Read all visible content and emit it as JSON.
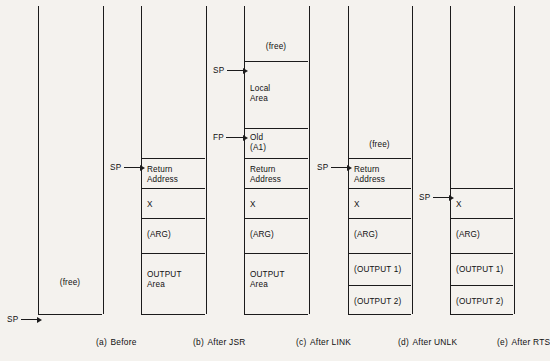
{
  "figure": {
    "pointer_names": {
      "sp": "SP",
      "fp": "FP"
    },
    "free_label": "(free)"
  },
  "columns": [
    {
      "id": "before",
      "caption_tag": "(a)",
      "caption_text": "Before",
      "slots": [
        {
          "name": "free-space",
          "label": "(free)",
          "align": "center"
        }
      ],
      "pointers": [
        {
          "name": "SP",
          "target": "stack-bottom"
        }
      ]
    },
    {
      "id": "after-jsr",
      "caption_tag": "(b)",
      "caption_text": "After JSR",
      "slots": [
        {
          "name": "free-space",
          "label": "",
          "align": "center"
        },
        {
          "name": "return-address",
          "label": "Return\nAddress",
          "align": "left"
        },
        {
          "name": "x-slot",
          "label": "X",
          "align": "left"
        },
        {
          "name": "arg-slot",
          "label": "(ARG)",
          "align": "left"
        },
        {
          "name": "output-area",
          "label": "OUTPUT\nArea",
          "align": "left"
        }
      ],
      "pointers": [
        {
          "name": "SP",
          "target": "return-address"
        }
      ]
    },
    {
      "id": "after-link",
      "caption_tag": "(c)",
      "caption_text": "After LINK",
      "slots": [
        {
          "name": "free-space",
          "label": "(free)",
          "align": "center"
        },
        {
          "name": "local-area",
          "label": "Local\nArea",
          "align": "left"
        },
        {
          "name": "old-a1",
          "label": "Old\n(A1)",
          "align": "left"
        },
        {
          "name": "return-address",
          "label": "Return\nAddress",
          "align": "left"
        },
        {
          "name": "x-slot",
          "label": "X",
          "align": "left"
        },
        {
          "name": "arg-slot",
          "label": "(ARG)",
          "align": "left"
        },
        {
          "name": "output-area",
          "label": "OUTPUT\nArea",
          "align": "left"
        }
      ],
      "pointers": [
        {
          "name": "SP",
          "target": "local-area"
        },
        {
          "name": "FP",
          "target": "old-a1"
        }
      ]
    },
    {
      "id": "after-unlk",
      "caption_tag": "(d)",
      "caption_text": "After UNLK",
      "slots": [
        {
          "name": "free-space",
          "label": "(free)",
          "align": "center"
        },
        {
          "name": "return-address",
          "label": "Return\nAddress",
          "align": "left"
        },
        {
          "name": "x-slot",
          "label": "X",
          "align": "left"
        },
        {
          "name": "arg-slot",
          "label": "(ARG)",
          "align": "left"
        },
        {
          "name": "output-1",
          "label": "(OUTPUT 1)",
          "align": "left"
        },
        {
          "name": "output-2",
          "label": "(OUTPUT 2)",
          "align": "left"
        }
      ],
      "pointers": [
        {
          "name": "SP",
          "target": "return-address"
        }
      ]
    },
    {
      "id": "after-rts",
      "caption_tag": "(e)",
      "caption_text": "After RTS",
      "slots": [
        {
          "name": "free-space",
          "label": "",
          "align": "center"
        },
        {
          "name": "x-slot",
          "label": "X",
          "align": "left"
        },
        {
          "name": "arg-slot",
          "label": "(ARG)",
          "align": "left"
        },
        {
          "name": "output-1",
          "label": "(OUTPUT 1)",
          "align": "left"
        },
        {
          "name": "output-2",
          "label": "(OUTPUT 2)",
          "align": "left"
        }
      ],
      "pointers": [
        {
          "name": "SP",
          "target": "x-slot"
        }
      ]
    }
  ]
}
